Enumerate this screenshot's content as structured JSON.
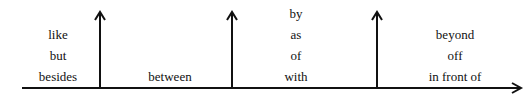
{
  "diagram": {
    "groups": [
      {
        "words": [
          "like",
          "but",
          "besides"
        ]
      },
      {
        "words": [
          "between"
        ]
      },
      {
        "words": [
          "by",
          "as",
          "of",
          "with"
        ]
      },
      {
        "words": [
          "beyond",
          "off",
          "in front of"
        ]
      }
    ],
    "line_color": "#111111"
  }
}
